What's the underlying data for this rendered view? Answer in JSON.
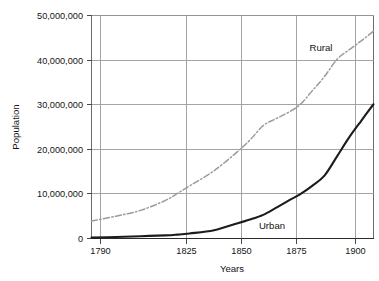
{
  "chart_data": {
    "type": "line",
    "title": "",
    "xlabel": "Years",
    "ylabel": "Population",
    "xlim": [
      1790,
      1905
    ],
    "ylim": [
      0,
      50000000
    ],
    "grid": true,
    "legend_position": "inline-annotation",
    "x_ticks": [
      1790,
      1825,
      1850,
      1875,
      1900
    ],
    "x_tick_labels": [
      "1790",
      "1825",
      "1850",
      "1875",
      "1900"
    ],
    "y_ticks": [
      0,
      10000000,
      20000000,
      30000000,
      40000000,
      50000000
    ],
    "y_tick_labels": [
      "0",
      "10,000,000",
      "20,000,000",
      "30,000,000",
      "40,000,000",
      "50,000,000"
    ],
    "annotations": [
      {
        "text": "Rural",
        "x": 1887,
        "y": 42500000
      },
      {
        "text": "Urban",
        "x": 1861,
        "y": 5200000
      }
    ],
    "series": [
      {
        "name": "Rural",
        "style": "dash-dot",
        "color": "#9b9b9b",
        "x": [
          1790,
          1800,
          1810,
          1820,
          1825,
          1830,
          1840,
          1850,
          1855,
          1860,
          1865,
          1870,
          1875,
          1880,
          1885,
          1890,
          1895,
          1900,
          1905
        ],
        "values": [
          3900000,
          5000000,
          6300000,
          8500000,
          10100000,
          11800000,
          15200000,
          19700000,
          22300000,
          25300000,
          26800000,
          28200000,
          30000000,
          33100000,
          36300000,
          40100000,
          42300000,
          44300000,
          46500000
        ]
      },
      {
        "name": "Urban",
        "style": "solid",
        "color": "#1c1c1c",
        "x": [
          1790,
          1800,
          1810,
          1820,
          1825,
          1830,
          1840,
          1850,
          1855,
          1860,
          1865,
          1870,
          1875,
          1880,
          1885,
          1890,
          1895,
          1900,
          1905
        ],
        "values": [
          200000,
          320000,
          520000,
          690000,
          870000,
          1130000,
          1850000,
          3500000,
          4300000,
          5300000,
          6800000,
          8400000,
          9900000,
          11800000,
          14100000,
          18300000,
          22600000,
          26400000,
          30100000
        ]
      }
    ]
  },
  "axes": {
    "y_title": "Population",
    "x_title": "Years"
  },
  "labels": {
    "rural": "Rural",
    "urban": "Urban"
  },
  "ticks": {
    "y": {
      "t0": "0",
      "t10": "10,000,000",
      "t20": "20,000,000",
      "t30": "30,000,000",
      "t40": "40,000,000",
      "t50": "50,000,000"
    },
    "x": {
      "t1790": "1790",
      "t1825": "1825",
      "t1850": "1850",
      "t1875": "1875",
      "t1900": "1900"
    }
  },
  "colors": {
    "urban_line": "#1c1c1c",
    "rural_line": "#9b9b9b",
    "grid": "#9a9a9a",
    "frame": "#6b6b6b",
    "background": "#ffffff"
  }
}
